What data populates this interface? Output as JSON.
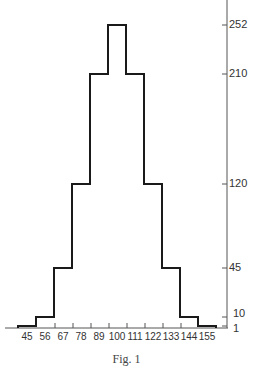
{
  "chart_data": {
    "type": "bar",
    "style": "step-histogram",
    "title": "",
    "caption": "Fig. 1",
    "xlabel": "",
    "ylabel": "",
    "categories": [
      "45",
      "56",
      "67",
      "78",
      "89",
      "100",
      "111",
      "122",
      "133",
      "144",
      "155"
    ],
    "values": [
      1,
      10,
      45,
      120,
      210,
      252,
      210,
      120,
      45,
      10,
      1
    ],
    "x_tick_labels": [
      "45",
      "56",
      "67",
      "78",
      "89",
      "100",
      "111",
      "122",
      "133",
      "144",
      "155"
    ],
    "y_tick_labels": [
      "252",
      "210",
      "120",
      "45",
      "10",
      "1"
    ],
    "y_ticks": [
      252,
      210,
      120,
      45,
      10,
      1
    ],
    "y_axis_position": "right",
    "ylim": [
      0,
      262
    ],
    "grid": false,
    "legend": null,
    "colors": {
      "line": "#1a1a1a",
      "axis": "#555555",
      "background": "#ffffff"
    }
  }
}
